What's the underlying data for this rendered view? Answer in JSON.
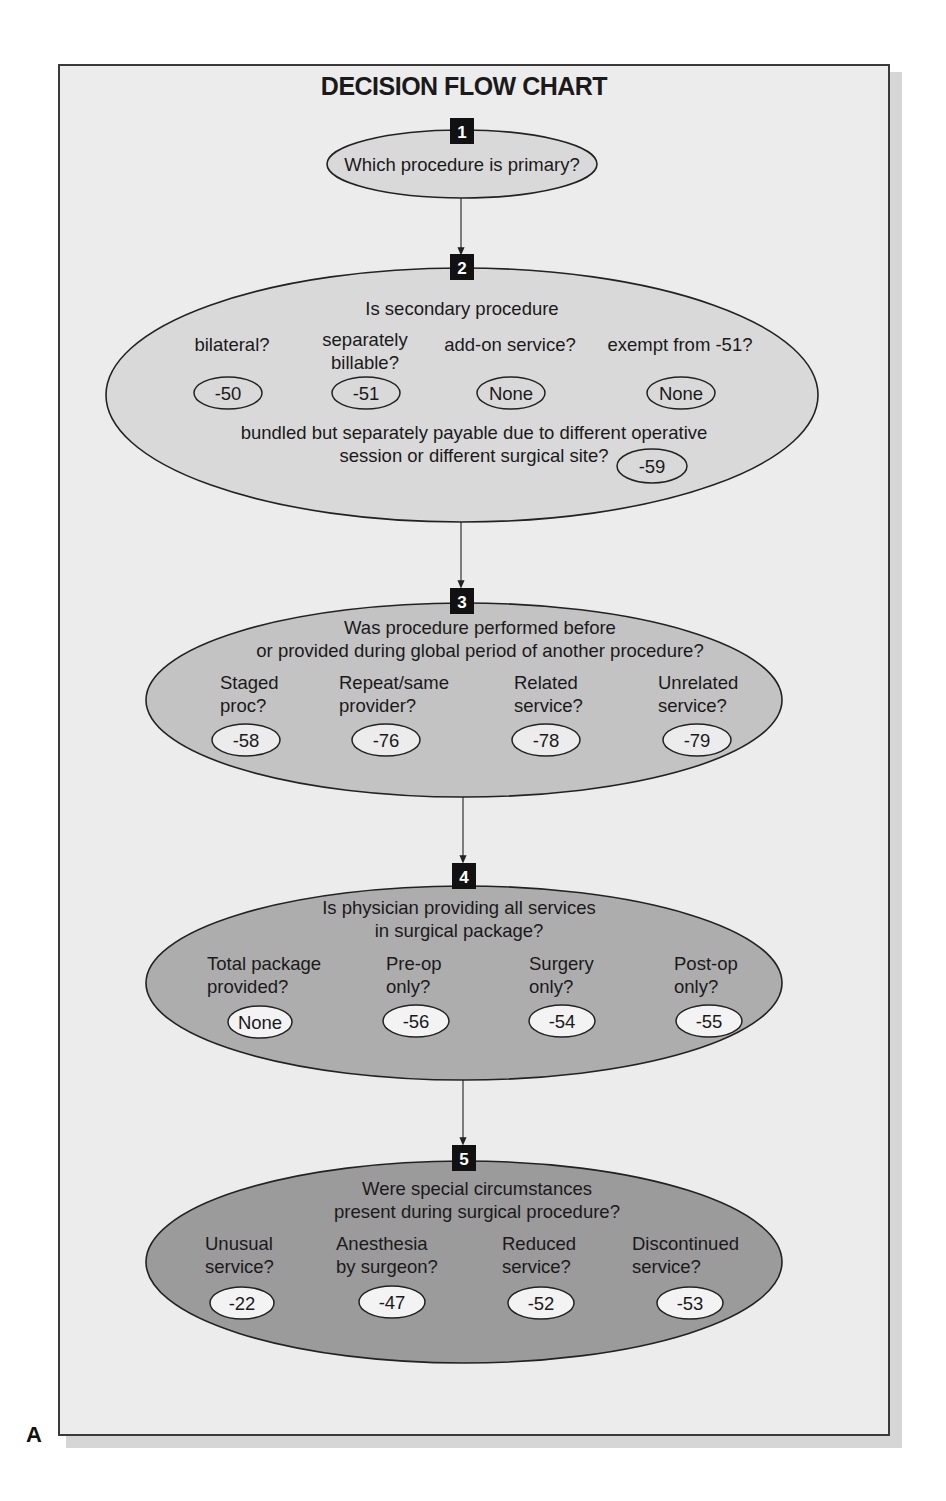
{
  "figure_label": "A",
  "title": "DECISION FLOW CHART",
  "colors": {
    "page_background": "#ececec",
    "border": "#3a3a3a",
    "step1_fill": "#d9d9d9",
    "step2_fill": "#d9d9d9",
    "step3_fill": "#c3c3c3",
    "step4_fill": "#adadad",
    "step5_fill": "#9b9b9b",
    "code_fill_light": "#ececec",
    "code_fill_dark": "#f3f3f3",
    "badge": "#111111"
  },
  "steps": [
    {
      "number": "1",
      "question": [
        "Which procedure is primary?"
      ]
    },
    {
      "number": "2",
      "question": [
        "Is secondary procedure"
      ],
      "options": [
        {
          "label": [
            "bilateral?"
          ],
          "code": "-50"
        },
        {
          "label": [
            "separately",
            "billable?"
          ],
          "code": "-51"
        },
        {
          "label": [
            "add-on service?"
          ],
          "code": "None"
        },
        {
          "label": [
            "exempt from -51?"
          ],
          "code": "None"
        }
      ],
      "extra": {
        "label": [
          "bundled but separately payable due to different operative",
          "session or different surgical site?"
        ],
        "code": "-59"
      }
    },
    {
      "number": "3",
      "question": [
        "Was procedure performed before",
        "or provided during global period of another procedure?"
      ],
      "options": [
        {
          "label": [
            "Staged",
            "proc?"
          ],
          "code": "-58"
        },
        {
          "label": [
            "Repeat/same",
            "provider?"
          ],
          "code": "-76"
        },
        {
          "label": [
            "Related",
            "service?"
          ],
          "code": "-78"
        },
        {
          "label": [
            "Unrelated",
            "service?"
          ],
          "code": "-79"
        }
      ]
    },
    {
      "number": "4",
      "question": [
        "Is physician providing all services",
        "in surgical package?"
      ],
      "options": [
        {
          "label": [
            "Total package",
            "provided?"
          ],
          "code": "None"
        },
        {
          "label": [
            "Pre-op",
            "only?"
          ],
          "code": "-56"
        },
        {
          "label": [
            "Surgery",
            "only?"
          ],
          "code": "-54"
        },
        {
          "label": [
            "Post-op",
            "only?"
          ],
          "code": "-55"
        }
      ]
    },
    {
      "number": "5",
      "question": [
        "Were special circumstances",
        "present during surgical procedure?"
      ],
      "options": [
        {
          "label": [
            "Unusual",
            "service?"
          ],
          "code": "-22"
        },
        {
          "label": [
            "Anesthesia",
            "by surgeon?"
          ],
          "code": "-47"
        },
        {
          "label": [
            "Reduced",
            "service?"
          ],
          "code": "-52"
        },
        {
          "label": [
            "Discontinued",
            "service?"
          ],
          "code": "-53"
        }
      ]
    }
  ]
}
